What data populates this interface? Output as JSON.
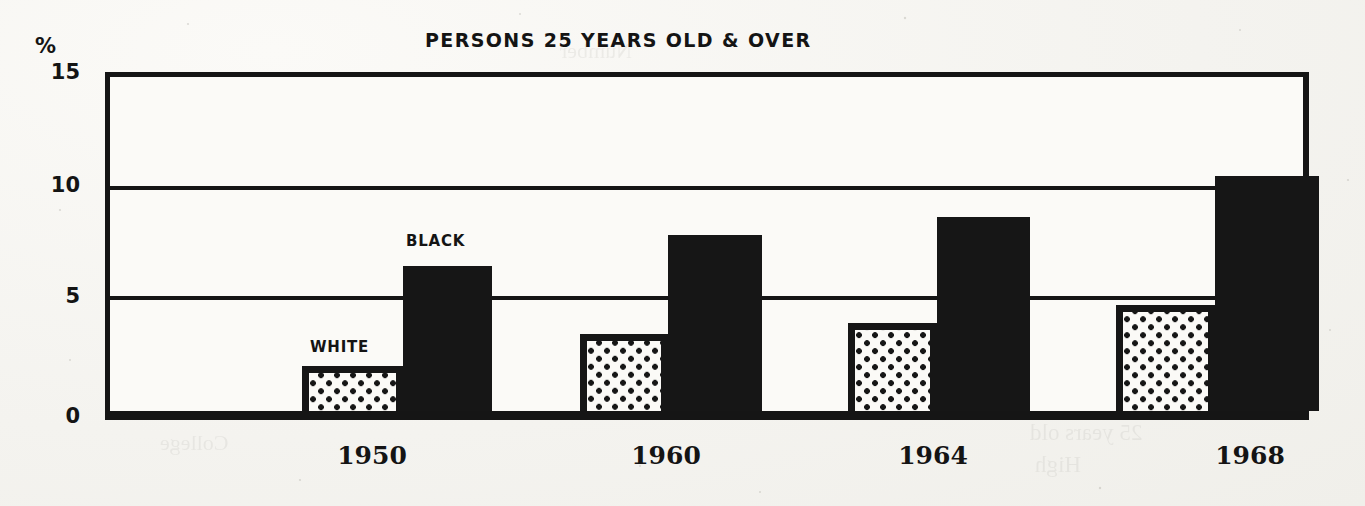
{
  "chart_data": {
    "type": "bar",
    "title": "PERSONS 25 YEARS OLD & OVER",
    "xlabel": "",
    "ylabel": "%",
    "ylim": [
      0,
      15
    ],
    "yticks": [
      "0",
      "5",
      "10",
      "15"
    ],
    "ytick_values": [
      0,
      5,
      10,
      15
    ],
    "grid": true,
    "legend_position": "inline-above-bars",
    "categories": [
      "1950",
      "1960",
      "1964",
      "1968"
    ],
    "series": [
      {
        "name": "WHITE",
        "pattern": "dotted",
        "color": "#161616",
        "fill": "#fbfaf7",
        "values": [
          2.0,
          3.4,
          3.9,
          4.7
        ]
      },
      {
        "name": "BLACK",
        "pattern": "solid",
        "color": "#161616",
        "fill": "#161616",
        "values": [
          6.4,
          7.8,
          8.6,
          10.4
        ]
      }
    ]
  },
  "figure": {
    "title": "PERSONS 25 YEARS OLD & OVER",
    "percent_sign": "%",
    "background_color": "#f7f6f3",
    "ink_color": "#161616"
  },
  "bleed_through": {
    "lines": [
      "Age and Race",
      "Less than",
      "College",
      "High",
      "school",
      "1 year",
      "or more",
      "25 years old",
      "Number"
    ]
  }
}
